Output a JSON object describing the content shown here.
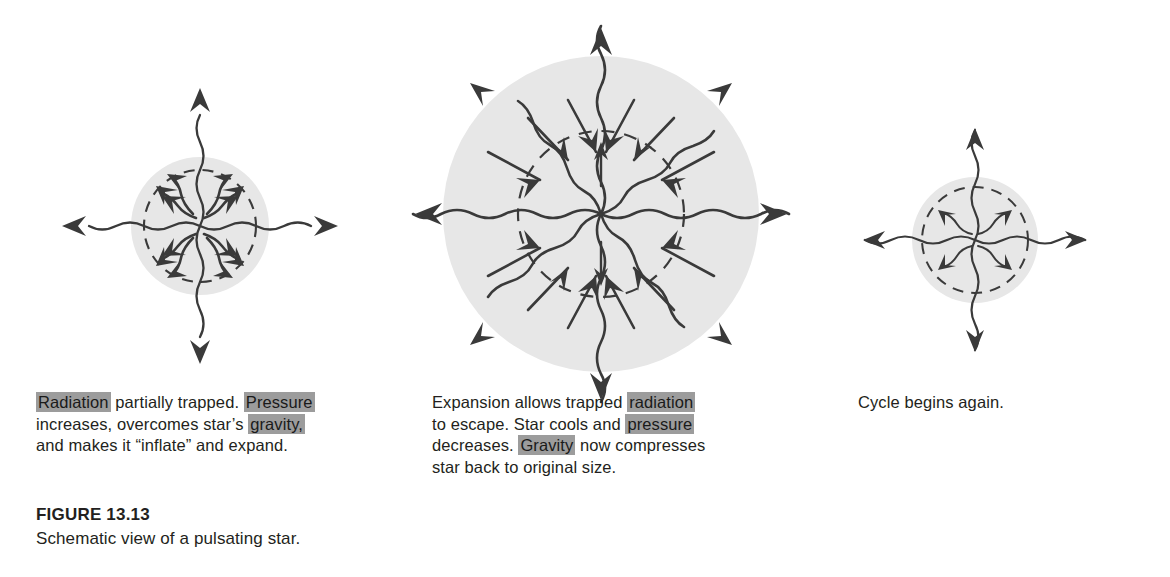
{
  "figure": {
    "number_label": "FIGURE 13.13",
    "title": "Schematic view of a pulsating star.",
    "disc_fill_color": "#e7e7e7",
    "ink_color": "#3a3a3a",
    "highlight_color": "#9c9c9c",
    "background_color": "#ffffff"
  },
  "panels": [
    {
      "id": "contracted-trapped",
      "order": 1,
      "state_label": "Radiation partially trapped",
      "center": {
        "x": 200,
        "y": 226
      },
      "outer_radius": 69,
      "inner_radius": 56,
      "escaping_rays": 4,
      "interior_rays": 8,
      "interior_ray_direction": "outward",
      "caption_lines": [
        [
          {
            "text": "Radiation",
            "highlight": true
          },
          {
            "text": " partially trapped. ",
            "highlight": false
          },
          {
            "text": "Pressure",
            "highlight": true
          }
        ],
        [
          {
            "text": "increases, overcomes star’s ",
            "highlight": false
          },
          {
            "text": "gravity,",
            "highlight": true
          }
        ],
        [
          {
            "text": "and makes it “inflate” and expand.",
            "highlight": false
          }
        ]
      ]
    },
    {
      "id": "expanded-escaping",
      "order": 2,
      "state_label": "Expansion allows trapped radiation to escape",
      "center": {
        "x": 601,
        "y": 214
      },
      "outer_radius": 158,
      "inner_radius": 83,
      "escaping_rays": 8,
      "interior_rays": 12,
      "interior_ray_direction": "inward",
      "caption_lines": [
        [
          {
            "text": "Expansion allows trapped ",
            "highlight": false
          },
          {
            "text": "radiation",
            "highlight": true
          }
        ],
        [
          {
            "text": "to escape. Star cools and ",
            "highlight": false
          },
          {
            "text": "pressure",
            "highlight": true
          }
        ],
        [
          {
            "text": "decreases. ",
            "highlight": false
          },
          {
            "text": "Gravity",
            "highlight": true
          },
          {
            "text": " now compresses",
            "highlight": false
          }
        ],
        [
          {
            "text": "star back to original size.",
            "highlight": false
          }
        ]
      ]
    },
    {
      "id": "cycle-restart",
      "order": 3,
      "state_label": "Cycle begins again",
      "center": {
        "x": 975,
        "y": 240
      },
      "outer_radius": 63,
      "inner_radius": 53,
      "escaping_rays": 4,
      "interior_rays": 4,
      "interior_ray_direction": "outward",
      "caption_lines": [
        [
          {
            "text": "Cycle begins again.",
            "highlight": false
          }
        ]
      ]
    }
  ]
}
